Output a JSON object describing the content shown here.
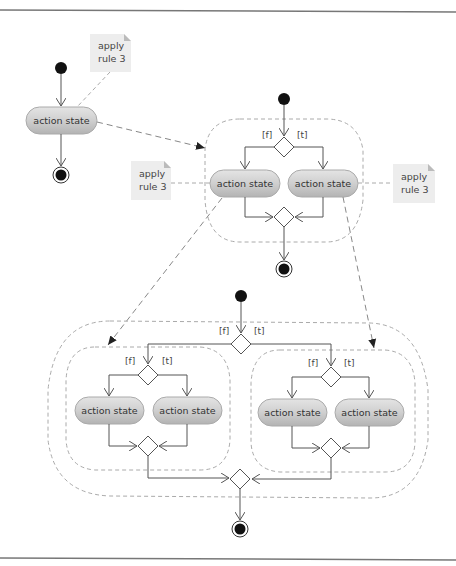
{
  "diagram": {
    "title": "",
    "action_label": "action state",
    "note_label_line1": "apply",
    "note_label_line2": "rule 3",
    "guard_false": "[f]",
    "guard_true": "[t]",
    "colors": {
      "action_fill": "#c8c8c8",
      "action_highlight": "#e6e6e6",
      "note_fill": "#ededed",
      "line": "#555555",
      "dashed": "#999999",
      "frame": "#777777"
    },
    "panels": [
      {
        "name": "simple-activity",
        "actions": [
          "action state"
        ],
        "notes": [
          "apply rule 3"
        ]
      },
      {
        "name": "rule3-applied-once",
        "actions": [
          "action state",
          "action state"
        ],
        "notes": [
          "apply rule 3",
          "apply rule 3"
        ],
        "guards": [
          "[f]",
          "[t]"
        ]
      },
      {
        "name": "rule3-applied-twice",
        "actions": [
          "action state",
          "action state",
          "action state",
          "action state"
        ],
        "guards": [
          "[f]",
          "[t]",
          "[f]",
          "[t]",
          "[f]",
          "[t]"
        ]
      }
    ]
  }
}
